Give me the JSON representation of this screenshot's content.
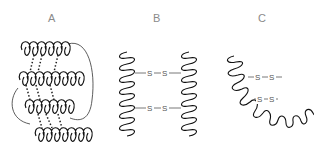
{
  "figure": {
    "panels": [
      {
        "label": "A",
        "description": "Coiled helices arranged in stacked rows with dotted interchain links, enclosed by a loop"
      },
      {
        "label": "B",
        "description": "Two parallel vertical helices linked by two disulfide bridges"
      },
      {
        "label": "C",
        "description": "Single helix folded into U-shape with two internal disulfide bridges"
      }
    ],
    "bridge_label": "S",
    "bridges": {
      "B": [
        "—S—S—",
        "—S—S—"
      ],
      "C": [
        "-S—S-",
        "-S—S-"
      ]
    }
  }
}
